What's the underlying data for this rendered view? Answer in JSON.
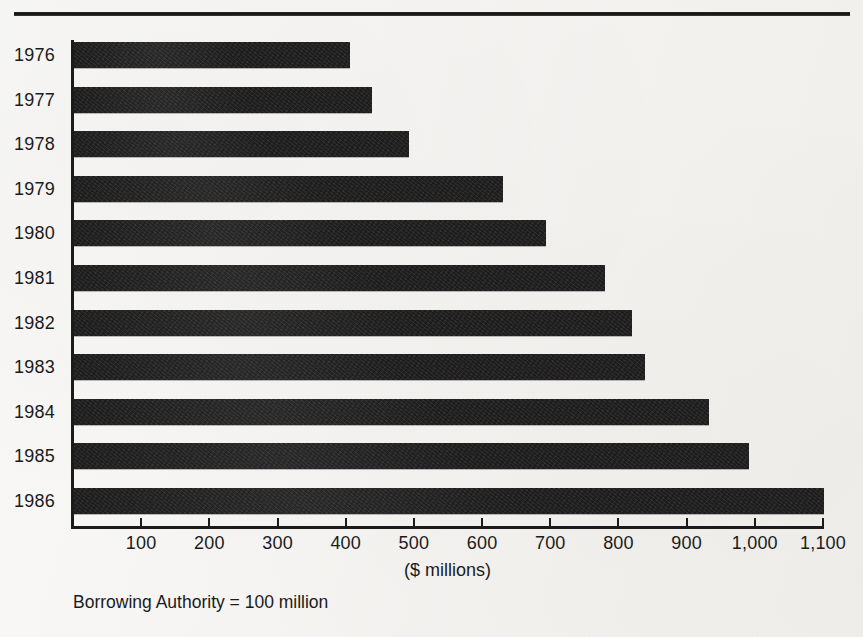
{
  "chart_data": {
    "type": "bar",
    "orientation": "horizontal",
    "title": "",
    "subtitle": "",
    "xlabel": "($ millions)",
    "ylabel": "",
    "categories": [
      "1976",
      "1977",
      "1978",
      "1979",
      "1980",
      "1981",
      "1982",
      "1983",
      "1984",
      "1985",
      "1986"
    ],
    "values": [
      405,
      437,
      492,
      629,
      692,
      779,
      818,
      838,
      932,
      990,
      1100
    ],
    "xlim": [
      0,
      1100
    ],
    "xticks": [
      0,
      100,
      200,
      300,
      400,
      500,
      600,
      700,
      800,
      900,
      1000,
      1100
    ],
    "xtick_labels": [
      "",
      "100",
      "200",
      "300",
      "400",
      "500",
      "600",
      "700",
      "800",
      "900",
      "1,000",
      "1,100"
    ],
    "grid": false,
    "legend": null,
    "annotations": [
      "Borrowing Authority  =  100 million"
    ],
    "bar_color": "#1d1d1d",
    "background_color": "#f2f1ee"
  },
  "axis": {
    "x_title": "($ millions)",
    "tick_labels": [
      "100",
      "200",
      "300",
      "400",
      "500",
      "600",
      "700",
      "800",
      "900",
      "1,000",
      "1,100"
    ]
  },
  "footnote": {
    "text": "Borrowing Authority  =  100 million"
  },
  "bars": [
    {
      "year": "1976",
      "value": 405
    },
    {
      "year": "1977",
      "value": 437
    },
    {
      "year": "1978",
      "value": 492
    },
    {
      "year": "1979",
      "value": 629
    },
    {
      "year": "1980",
      "value": 692
    },
    {
      "year": "1981",
      "value": 779
    },
    {
      "year": "1982",
      "value": 818
    },
    {
      "year": "1983",
      "value": 838
    },
    {
      "year": "1984",
      "value": 932
    },
    {
      "year": "1985",
      "value": 990
    },
    {
      "year": "1986",
      "value": 1100
    }
  ]
}
